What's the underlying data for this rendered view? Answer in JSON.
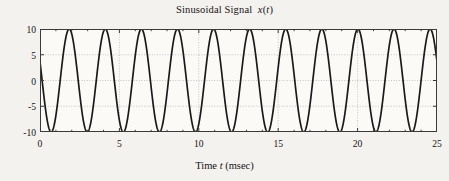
{
  "figure": {
    "background_color": "#f4f2ee",
    "title_prefix": "Sinusoidal Signal  ",
    "title_var": "x",
    "title_paren_open": "(",
    "title_arg": "t",
    "title_paren_close": ")",
    "title_full": "Sinusoidal Signal  x(t)"
  },
  "axes": {
    "x_label_prefix": "Time ",
    "x_label_var": "t",
    "x_label_unit": " (msec)",
    "x_label_full": "Time t (msec)",
    "y_label": "",
    "frame_color": "#3a3a3a",
    "grid_color": "#b9b9b9",
    "curve_color": "#1a1a1a"
  },
  "chart_data": {
    "type": "line",
    "title": "Sinusoidal Signal  x(t)",
    "xlabel": "Time t (msec)",
    "ylabel": "",
    "xlim": [
      0,
      25
    ],
    "ylim": [
      -10,
      10
    ],
    "xticks": [
      0,
      5,
      10,
      15,
      20,
      25
    ],
    "xtick_labels": [
      "0",
      "5",
      "10",
      "15",
      "20",
      "25"
    ],
    "yticks": [
      -10,
      -5,
      0,
      5,
      10
    ],
    "ytick_labels": [
      "-10",
      "-5",
      "0",
      "5",
      "10"
    ],
    "grid": true,
    "grid_style": "dotted",
    "legend": null,
    "series": [
      {
        "name": "x(t)",
        "color": "#1a1a1a",
        "line_width": 1.7,
        "equation": "x(t) = 10 * cos(2*pi*0.44*t + 1.2)",
        "amplitude": 10,
        "frequency_khz": 0.44,
        "frequency_hz": 440,
        "period_msec": 2.273,
        "phase_rad": 1.2,
        "cycles_shown": 11,
        "value_at_t0": 3.62,
        "samples_per_msec": 80
      }
    ],
    "peaks_t": [
      2.27,
      4.55,
      6.82,
      9.09,
      11.36,
      13.64,
      15.91,
      18.18,
      20.45,
      22.73
    ],
    "peak_value": 10,
    "trough_value": -10
  }
}
